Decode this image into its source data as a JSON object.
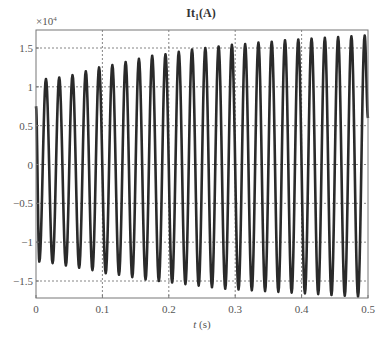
{
  "chart_data": {
    "type": "line",
    "title": "It1(A)",
    "title_main": "It",
    "title_sub": "1",
    "title_unit": "(A)",
    "xlabel": "t (s)",
    "xlabel_var": "t",
    "xlabel_unit": " (s)",
    "ylabel": "",
    "y_multiplier": "×10",
    "y_multiplier_exp": "4",
    "xlim": [
      0,
      0.5
    ],
    "ylim": [
      -1.75,
      1.75
    ],
    "xticks": [
      0,
      0.1,
      0.2,
      0.3,
      0.4,
      0.5
    ],
    "xtick_labels": [
      "0",
      "0.1",
      "0.2",
      "0.3",
      "0.4",
      "0.5"
    ],
    "yticks": [
      1.5,
      1,
      0.5,
      0,
      -0.5,
      -1,
      -1.5
    ],
    "ytick_labels": [
      "1.5",
      "1",
      "0.5",
      "0",
      "−0.5",
      "−1",
      "−1.5"
    ],
    "grid": true,
    "legend": null,
    "series": [
      {
        "name": "It1",
        "frequency_hz": 50,
        "description": "Sinusoidal current with growing amplitude, 25 cycles over 0.5 s",
        "start_value": 0.75,
        "peaks": [
          {
            "t": 0.015,
            "value": 1.1
          },
          {
            "t": 0.035,
            "value": 1.12
          },
          {
            "t": 0.055,
            "value": 1.15
          },
          {
            "t": 0.075,
            "value": 1.2
          },
          {
            "t": 0.095,
            "value": 1.25
          },
          {
            "t": 0.115,
            "value": 1.28
          },
          {
            "t": 0.135,
            "value": 1.32
          },
          {
            "t": 0.155,
            "value": 1.36
          },
          {
            "t": 0.175,
            "value": 1.4
          },
          {
            "t": 0.195,
            "value": 1.42
          },
          {
            "t": 0.215,
            "value": 1.45
          },
          {
            "t": 0.235,
            "value": 1.48
          },
          {
            "t": 0.255,
            "value": 1.5
          },
          {
            "t": 0.275,
            "value": 1.52
          },
          {
            "t": 0.295,
            "value": 1.54
          },
          {
            "t": 0.315,
            "value": 1.55
          },
          {
            "t": 0.335,
            "value": 1.57
          },
          {
            "t": 0.355,
            "value": 1.58
          },
          {
            "t": 0.375,
            "value": 1.6
          },
          {
            "t": 0.395,
            "value": 1.61
          },
          {
            "t": 0.415,
            "value": 1.62
          },
          {
            "t": 0.435,
            "value": 1.63
          },
          {
            "t": 0.455,
            "value": 1.64
          },
          {
            "t": 0.475,
            "value": 1.65
          },
          {
            "t": 0.495,
            "value": 1.66
          }
        ],
        "troughs": [
          {
            "t": 0.005,
            "value": -1.25
          },
          {
            "t": 0.025,
            "value": -1.27
          },
          {
            "t": 0.045,
            "value": -1.3
          },
          {
            "t": 0.065,
            "value": -1.33
          },
          {
            "t": 0.085,
            "value": -1.36
          },
          {
            "t": 0.105,
            "value": -1.4
          },
          {
            "t": 0.125,
            "value": -1.42
          },
          {
            "t": 0.145,
            "value": -1.45
          },
          {
            "t": 0.165,
            "value": -1.48
          },
          {
            "t": 0.185,
            "value": -1.5
          },
          {
            "t": 0.205,
            "value": -1.52
          },
          {
            "t": 0.225,
            "value": -1.54
          },
          {
            "t": 0.245,
            "value": -1.56
          },
          {
            "t": 0.265,
            "value": -1.58
          },
          {
            "t": 0.285,
            "value": -1.6
          },
          {
            "t": 0.305,
            "value": -1.61
          },
          {
            "t": 0.325,
            "value": -1.62
          },
          {
            "t": 0.345,
            "value": -1.63
          },
          {
            "t": 0.365,
            "value": -1.64
          },
          {
            "t": 0.385,
            "value": -1.65
          },
          {
            "t": 0.405,
            "value": -1.66
          },
          {
            "t": 0.425,
            "value": -1.67
          },
          {
            "t": 0.445,
            "value": -1.68
          },
          {
            "t": 0.465,
            "value": -1.69
          },
          {
            "t": 0.485,
            "value": -1.7
          }
        ],
        "color": "#2a2a2a"
      }
    ]
  },
  "style": {
    "line_color": "#2a2a2a",
    "grid_color": "#666666",
    "axis_color": "#777777",
    "background": "#ffffff"
  }
}
